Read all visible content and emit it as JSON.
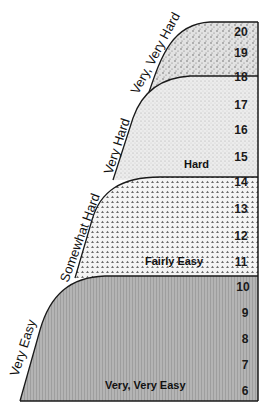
{
  "diagram": {
    "type": "perceived-exertion-scale",
    "scale": {
      "min": 6,
      "max": 20,
      "numbers": [
        "20",
        "19",
        "18",
        "17",
        "16",
        "15",
        "14",
        "13",
        "12",
        "11",
        "10",
        "9",
        "8",
        "7",
        "6"
      ]
    },
    "zones": [
      {
        "id": "very-very-hard",
        "range": [
          18,
          20
        ],
        "side_label": "Very, Very Hard",
        "inner_label": ""
      },
      {
        "id": "hard",
        "range": [
          14,
          18
        ],
        "side_label": "Very Hard",
        "inner_label": "Hard"
      },
      {
        "id": "fairly-easy",
        "range": [
          10,
          14
        ],
        "side_label": "Somewhat Hard",
        "inner_label": "Fairly Easy"
      },
      {
        "id": "very-very-easy",
        "range": [
          6,
          10
        ],
        "side_label": "Very Easy",
        "inner_label": "Very, Very Easy"
      }
    ],
    "colors": {
      "background": "#ffffff",
      "outline": "#1a1a1a",
      "very_very_hard_fill": "#d9d9d9",
      "hard_fill": "#e6e6e6",
      "fairly_easy_fill": "#d4d4d4",
      "very_very_easy_fill": "#a9a9a9"
    }
  }
}
